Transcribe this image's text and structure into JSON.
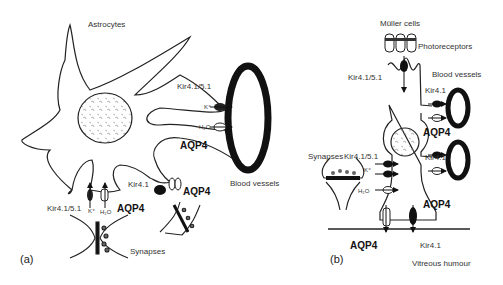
{
  "panel_a": {
    "label": "(a)",
    "title": "Astrocytes",
    "channels": {
      "kir_top": "Kir4.1/5.1",
      "k_top": "K⁺",
      "h2o_top": "H₂O",
      "aqp4_top": "AQP4",
      "kir_bottom": "Kir4.1/5.1",
      "k_bottom": "K⁺",
      "h2o_bottom": "H₂O",
      "aqp4_bottom": "AQP4",
      "kir_mid": "Kir4.1",
      "k_mid": "K⁺",
      "h2o_mid": "H₂O",
      "aqp4_mid": "AQP4"
    },
    "blood_vessels": "Blood vessels",
    "synapses": "Synapses"
  },
  "panel_b": {
    "label": "(b)",
    "title": "Müller cells",
    "photoreceptors": "Photoreceptors",
    "blood_vessels": "Blood vessels",
    "channels": {
      "kir_top": "Kir4.1/5.1",
      "kir_vessel_1": "Kir4.1",
      "aqp4_vessel_1": "AQP4",
      "kir_synapse": "Kir4.1/5.1",
      "k_synapse": "K⁺",
      "h2o_synapse": "H₂O",
      "kir_vessel_2": "Kir4.1",
      "aqp4_vessel_2": "AQP4",
      "aqp4_endfoot": "AQP4",
      "kir_endfoot": "Kir4.1"
    },
    "synapses": "Synapses",
    "vitreous": "Vitreous humour"
  }
}
